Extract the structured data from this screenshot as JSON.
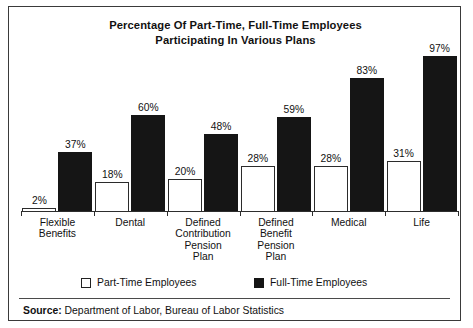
{
  "figure": {
    "title_lines": [
      "Percentage Of Part-Time, Full-Time Employees",
      "Participating In Various Plans"
    ],
    "source_label": "Source:",
    "source_text": " Department of Labor, Bureau of Labor Statistics",
    "frame_color": "#3a3a3a"
  },
  "legend": {
    "items": [
      {
        "label": "Part-Time Employees",
        "swatch": "white-square-icon",
        "color": "#ffffff"
      },
      {
        "label": "Full-Time Employees",
        "swatch": "black-square-icon",
        "color": "#151515"
      }
    ]
  },
  "chart_data": {
    "type": "bar",
    "title": "Percentage Of Part-Time, Full-Time Employees Participating In Various Plans",
    "subtitle": "",
    "xlabel": "",
    "ylabel": "",
    "ylim": [
      0,
      100
    ],
    "grid": false,
    "legend_position": "bottom",
    "value_suffix": "%",
    "categories": [
      "Flexible Benefits",
      "Dental",
      "Defined Contribution Pension Plan",
      "Defined Benefit Pension Plan",
      "Medical",
      "Life"
    ],
    "category_label_lines": [
      [
        "Flexible",
        "Benefits"
      ],
      [
        "Dental"
      ],
      [
        "Defined",
        "Contribution",
        "Pension",
        "Plan"
      ],
      [
        "Defined",
        "Benefit",
        "Pension",
        "Plan"
      ],
      [
        "Medical"
      ],
      [
        "Life"
      ]
    ],
    "series": [
      {
        "name": "Part-Time Employees",
        "color": "#ffffff",
        "values": [
          2,
          18,
          20,
          28,
          28,
          31
        ],
        "labels": [
          "2%",
          "18%",
          "20%",
          "28%",
          "28%",
          "31%"
        ]
      },
      {
        "name": "Full-Time Employees",
        "color": "#151515",
        "values": [
          37,
          60,
          48,
          59,
          83,
          97
        ],
        "labels": [
          "37%",
          "60%",
          "48%",
          "59%",
          "83%",
          "97%"
        ]
      }
    ]
  }
}
